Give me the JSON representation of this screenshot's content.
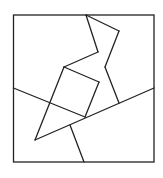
{
  "diagram": {
    "width": 163,
    "height": 178,
    "stroke_color": "#222222",
    "stroke_width": 1.3,
    "background": "#ffffff",
    "frame": {
      "x": 13.5,
      "y": 15,
      "width": 140.5,
      "height": 147
    },
    "segments": [
      {
        "name": "zigzag-top-to-right-peak",
        "x1": 86,
        "y1": 15,
        "x2": 119,
        "y2": 31
      },
      {
        "name": "right-peak-to-notch",
        "x1": 119,
        "y1": 31,
        "x2": 105,
        "y2": 67
      },
      {
        "name": "notch-to-lower-right",
        "x1": 105,
        "y1": 67,
        "x2": 119,
        "y2": 103
      },
      {
        "name": "zigzag-top-to-mid",
        "x1": 86,
        "y1": 15,
        "x2": 98,
        "y2": 52
      },
      {
        "name": "mid-to-square-top",
        "x1": 98,
        "y1": 52,
        "x2": 64,
        "y2": 67
      },
      {
        "name": "square-top-to-square-right",
        "x1": 64,
        "y1": 67,
        "x2": 99,
        "y2": 82
      },
      {
        "name": "square-right-to-square-bottom",
        "x1": 99,
        "y1": 82,
        "x2": 85,
        "y2": 117
      },
      {
        "name": "square-top-to-triangle-tip",
        "x1": 64,
        "y1": 67,
        "x2": 35,
        "y2": 140
      },
      {
        "name": "left-edge-diagonal",
        "x1": 13.5,
        "y1": 88,
        "x2": 85,
        "y2": 117
      },
      {
        "name": "long-diagonal",
        "x1": 154,
        "y1": 88,
        "x2": 35,
        "y2": 140
      },
      {
        "name": "bottom-stem",
        "x1": 70,
        "y1": 125,
        "x2": 84,
        "y2": 162
      }
    ]
  }
}
